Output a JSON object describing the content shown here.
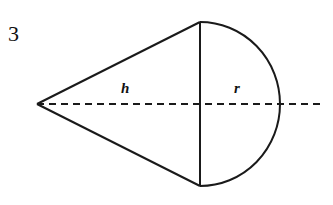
{
  "problem": {
    "number": "3"
  },
  "figure": {
    "labels": {
      "height": "h",
      "radius": "r"
    },
    "colors": {
      "stroke": "#1a1a1a",
      "background": "#ffffff"
    }
  }
}
